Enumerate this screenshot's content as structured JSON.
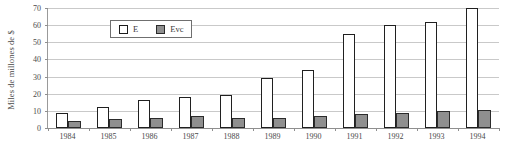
{
  "chart_data": {
    "type": "bar",
    "title": "",
    "subtitle": "",
    "xlabel": "",
    "ylabel": "Miles de millones de $",
    "categories": [
      "1984",
      "1985",
      "1986",
      "1987",
      "1988",
      "1989",
      "1990",
      "1991",
      "1992",
      "1993",
      "1994"
    ],
    "series": [
      {
        "name": "E",
        "values": [
          9,
          12,
          16.5,
          18,
          19,
          29,
          34,
          55,
          60,
          62,
          70
        ]
      },
      {
        "name": "Evc",
        "values": [
          4,
          5,
          6,
          7,
          6,
          6,
          7,
          8,
          8.5,
          10,
          10.5
        ]
      }
    ],
    "ylim": [
      0,
      70
    ],
    "yticks": [
      0,
      10,
      20,
      30,
      40,
      50,
      60,
      70
    ],
    "ytick_labels": [
      "0",
      "10",
      "20",
      "30",
      "40",
      "50",
      "60",
      "70"
    ],
    "grid": true,
    "grid_axis": "y",
    "legend_position": "top-left-inside",
    "legend_entries": [
      {
        "label": "E",
        "swatch": "open-square-white",
        "color": "#ffffff",
        "border": "#1c1c1c"
      },
      {
        "label": "Evc",
        "swatch": "filled-square-gray",
        "color": "#8f8f8f",
        "border": "#2b2b2b"
      }
    ],
    "colors": {
      "series_e_fill": "#ffffff",
      "series_e_stroke": "#202020",
      "series_evc_fill": "#8f8f8f",
      "series_evc_stroke": "#2b2b2b",
      "gridline": "#c9c9c9",
      "axis": "#8f8f8f",
      "text": "#4a4a4a",
      "background": "#ffffff"
    }
  }
}
